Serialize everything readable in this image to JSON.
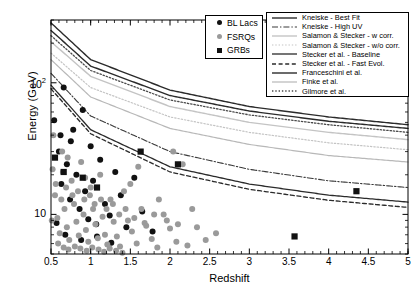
{
  "chart_data": {
    "type": "scatter",
    "title": "",
    "xlabel": "Redshift",
    "ylabel": "Energy (GeV)",
    "xlim": [
      0.5,
      5
    ],
    "ylim": [
      5,
      300
    ],
    "yscale": "log",
    "xscale": "linear",
    "grid": false,
    "legend_position": "top-right",
    "xticks": [
      "0.5",
      "1",
      "1.5",
      "2",
      "2.5",
      "3",
      "3.5",
      "4",
      "4.5",
      "5"
    ],
    "xtick_values": [
      0.5,
      1,
      1.5,
      2,
      2.5,
      3,
      3.5,
      4,
      4.5,
      5
    ],
    "yticks": [
      "10",
      "10^2"
    ],
    "ytick_values": [
      10,
      100
    ],
    "series": [
      {
        "name": "BL Lacs",
        "marker": "circle",
        "color": "#111111",
        "points": [
          [
            0.54,
            52
          ],
          [
            0.6,
            30
          ],
          [
            0.63,
            17
          ],
          [
            0.66,
            92
          ],
          [
            0.7,
            24
          ],
          [
            0.74,
            13
          ],
          [
            0.78,
            44
          ],
          [
            0.82,
            20
          ],
          [
            0.86,
            11
          ],
          [
            0.9,
            62
          ],
          [
            0.93,
            15
          ],
          [
            0.97,
            9.2
          ],
          [
            1.0,
            33
          ],
          [
            1.03,
            18
          ],
          [
            1.07,
            8.4
          ],
          [
            1.12,
            26
          ],
          [
            1.18,
            12
          ],
          [
            1.24,
            9.8
          ],
          [
            1.31,
            21
          ],
          [
            1.38,
            14
          ],
          [
            1.45,
            8.0
          ],
          [
            1.55,
            19
          ],
          [
            1.65,
            10.5
          ],
          [
            1.78,
            7.4
          ],
          [
            0.57,
            8.6
          ],
          [
            0.68,
            7.0
          ],
          [
            0.88,
            6.4
          ],
          [
            1.08,
            6.8
          ],
          [
            1.26,
            6.1
          ],
          [
            0.62,
            40
          ],
          [
            0.75,
            36
          ]
        ]
      },
      {
        "name": "FSRQs",
        "marker": "circle",
        "color": "#9a9a9a",
        "points": [
          [
            0.52,
            22
          ],
          [
            0.55,
            14
          ],
          [
            0.58,
            9.4
          ],
          [
            0.61,
            7.2
          ],
          [
            0.64,
            30
          ],
          [
            0.67,
            11
          ],
          [
            0.7,
            8.0
          ],
          [
            0.73,
            6.4
          ],
          [
            0.76,
            18
          ],
          [
            0.79,
            12
          ],
          [
            0.82,
            8.8
          ],
          [
            0.85,
            6.9
          ],
          [
            0.88,
            25
          ],
          [
            0.91,
            10
          ],
          [
            0.94,
            7.6
          ],
          [
            0.97,
            6.2
          ],
          [
            1.0,
            16
          ],
          [
            1.03,
            11
          ],
          [
            1.06,
            8.4
          ],
          [
            1.09,
            6.6
          ],
          [
            1.12,
            20
          ],
          [
            1.15,
            9.6
          ],
          [
            1.18,
            7.0
          ],
          [
            1.21,
            5.9
          ],
          [
            1.25,
            13
          ],
          [
            1.29,
            8.8
          ],
          [
            1.33,
            6.8
          ],
          [
            1.37,
            5.7
          ],
          [
            1.42,
            15
          ],
          [
            1.47,
            9.0
          ],
          [
            1.52,
            7.4
          ],
          [
            1.58,
            6.0
          ],
          [
            1.64,
            11
          ],
          [
            1.7,
            8.2
          ],
          [
            1.77,
            6.5
          ],
          [
            1.84,
            5.6
          ],
          [
            1.92,
            10
          ],
          [
            2.0,
            7.8
          ],
          [
            2.08,
            6.2
          ],
          [
            2.16,
            24
          ],
          [
            2.22,
            5.8
          ],
          [
            2.34,
            8.0
          ],
          [
            2.45,
            6.4
          ],
          [
            2.58,
            7.2
          ],
          [
            0.53,
            40
          ],
          [
            0.59,
            6.0
          ],
          [
            0.66,
            5.6
          ],
          [
            0.72,
            5.4
          ],
          [
            0.8,
            5.7
          ],
          [
            0.87,
            5.5
          ],
          [
            0.95,
            5.3
          ],
          [
            1.02,
            5.6
          ],
          [
            1.1,
            5.4
          ],
          [
            1.17,
            5.2
          ],
          [
            1.24,
            5.5
          ],
          [
            1.32,
            5.3
          ],
          [
            1.4,
            5.1
          ],
          [
            0.56,
            17
          ],
          [
            0.63,
            13
          ],
          [
            0.69,
            16
          ],
          [
            0.77,
            14
          ],
          [
            0.84,
            15
          ],
          [
            0.92,
            13
          ],
          [
            0.99,
            14
          ],
          [
            1.05,
            12
          ],
          [
            1.13,
            13
          ],
          [
            1.2,
            11
          ],
          [
            1.28,
            12
          ],
          [
            1.36,
            10
          ],
          [
            1.44,
            11
          ],
          [
            1.55,
            9.4
          ],
          [
            1.68,
            8.6
          ],
          [
            1.8,
            10
          ],
          [
            1.96,
            9.0
          ],
          [
            2.1,
            8.4
          ],
          [
            0.51,
            9.0
          ],
          [
            0.65,
            21
          ],
          [
            0.93,
            19
          ],
          [
            1.5,
            17
          ],
          [
            1.86,
            13
          ],
          [
            2.28,
            11
          ],
          [
            1.6,
            23
          ],
          [
            2.04,
            30
          ],
          [
            0.71,
            27
          ]
        ]
      },
      {
        "name": "GRBs",
        "marker": "square",
        "color": "#111111",
        "points": [
          [
            0.55,
            27
          ],
          [
            0.66,
            21
          ],
          [
            0.9,
            19
          ],
          [
            1.08,
            16
          ],
          [
            1.63,
            30
          ],
          [
            2.1,
            24
          ],
          [
            3.57,
            6.8
          ],
          [
            4.35,
            15
          ]
        ]
      }
    ],
    "curves": [
      {
        "name": "Kneiske - Best Fit",
        "style": "solid",
        "color": "#2b2b2b",
        "width": 1.4,
        "y_at_z": {
          "0.5": 285,
          "1": 150,
          "2": 88,
          "3": 66,
          "4": 55,
          "5": 48
        }
      },
      {
        "name": "Kneiske - High UV",
        "style": "dashdot",
        "color": "#3a3a3a",
        "width": 1.1,
        "y_at_z": {
          "0.5": 118,
          "1": 56,
          "2": 30,
          "3": 22,
          "4": 18,
          "5": 16
        }
      },
      {
        "name": "Salamon & Stecker - w corr.",
        "style": "solid",
        "color": "#c4c4c4",
        "width": 1.4,
        "y_at_z": {
          "0.5": 205,
          "1": 112,
          "2": 66,
          "3": 50,
          "4": 42,
          "5": 37
        }
      },
      {
        "name": "Salamon & Stecker - w/o corr.",
        "style": "dotted",
        "color": "#c4c4c4",
        "width": 1.2,
        "y_at_z": {
          "0.5": 168,
          "1": 92,
          "2": 55,
          "3": 42,
          "4": 35,
          "5": 31
        }
      },
      {
        "name": "Stecker et al. - Baseline",
        "style": "solid",
        "color": "#2b2b2b",
        "width": 1.3,
        "y_at_z": {
          "0.5": 96,
          "1": 44,
          "2": 23,
          "3": 17,
          "4": 14,
          "5": 12.4
        }
      },
      {
        "name": "Stecker et al. - Fast Evol.",
        "style": "dashed",
        "color": "#2b2b2b",
        "width": 1.3,
        "y_at_z": {
          "0.5": 90,
          "1": 41,
          "2": 21,
          "3": 15.5,
          "4": 12.8,
          "5": 11.3
        }
      },
      {
        "name": "Franceschini et al.",
        "style": "solid",
        "color": "#2b2b2b",
        "width": 1.4,
        "y_at_z": {
          "0.5": 250,
          "1": 134,
          "2": 80,
          "3": 61,
          "4": 51,
          "5": 45
        }
      },
      {
        "name": "Finke et al.",
        "style": "solid",
        "color": "#b8b8b8",
        "width": 1.2,
        "y_at_z": {
          "0.5": 150,
          "1": 78,
          "2": 45,
          "3": 34,
          "4": 28,
          "5": 25
        }
      },
      {
        "name": "Gilmore et al.",
        "style": "dotted",
        "color": "#4a4a4a",
        "width": 1.3,
        "y_at_z": {
          "0.5": 228,
          "1": 124,
          "2": 74,
          "3": 57,
          "4": 48,
          "5": 42
        }
      }
    ]
  },
  "axes": {
    "ylabel": "Energy (GeV)",
    "xlabel": "Redshift",
    "ytick_labels": [
      {
        "text": "10",
        "sup": "",
        "value": 10
      },
      {
        "text": "10",
        "sup": "2",
        "value": 100
      }
    ]
  },
  "marker_legend": {
    "items": [
      {
        "label": "BL Lacs",
        "marker": "circle-black"
      },
      {
        "label": "FSRQs",
        "marker": "circle-gray"
      },
      {
        "label": "GRBs",
        "marker": "square-black"
      }
    ]
  },
  "curve_legend": {
    "items": [
      {
        "label": "Kneiske - Best Fit"
      },
      {
        "label": "Kneiske - High UV"
      },
      {
        "label": "Salamon & Stecker - w corr."
      },
      {
        "label": "Salamon & Stecker - w/o corr."
      },
      {
        "label": "Stecker et al. - Baseline"
      },
      {
        "label": "Stecker et al. - Fast Evol."
      },
      {
        "label": "Franceschini et al."
      },
      {
        "label": "Finke et al."
      },
      {
        "label": "Gilmore et al."
      }
    ]
  },
  "caption": ""
}
